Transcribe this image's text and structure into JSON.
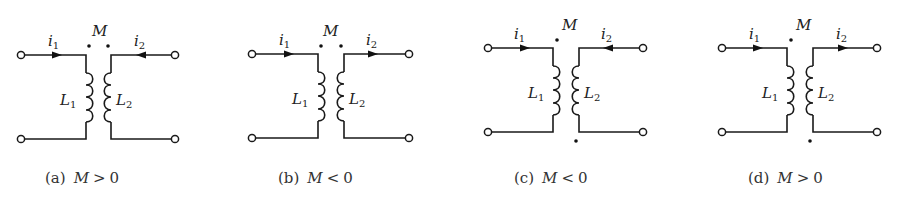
{
  "figure": {
    "panels": [
      {
        "id": "a",
        "caption_tag": "(a)",
        "caption_var": "M",
        "caption_op": ">",
        "caption_val": "0",
        "mutual_label": "M",
        "L1_label": "L",
        "L1_sub": "1",
        "L2_label": "L",
        "L2_sub": "2",
        "i1_label": "i",
        "i1_sub": "1",
        "i2_label": "i",
        "i2_sub": "2",
        "i1_direction": "right",
        "i2_direction": "left",
        "dots": "both-top"
      },
      {
        "id": "b",
        "caption_tag": "(b)",
        "caption_var": "M",
        "caption_op": "<",
        "caption_val": "0",
        "mutual_label": "M",
        "L1_label": "L",
        "L1_sub": "1",
        "L2_label": "L",
        "L2_sub": "2",
        "i1_label": "i",
        "i1_sub": "1",
        "i2_label": "i",
        "i2_sub": "2",
        "i1_direction": "right",
        "i2_direction": "right",
        "dots": "both-top"
      },
      {
        "id": "c",
        "caption_tag": "(c)",
        "caption_var": "M",
        "caption_op": "<",
        "caption_val": "0",
        "mutual_label": "M",
        "L1_label": "L",
        "L1_sub": "1",
        "L2_label": "L",
        "L2_sub": "2",
        "i1_label": "i",
        "i1_sub": "1",
        "i2_label": "i",
        "i2_sub": "2",
        "i1_direction": "right",
        "i2_direction": "left",
        "dots": "L1-top-L2-bottom"
      },
      {
        "id": "d",
        "caption_tag": "(d)",
        "caption_var": "M",
        "caption_op": ">",
        "caption_val": "0",
        "mutual_label": "M",
        "L1_label": "L",
        "L1_sub": "1",
        "L2_label": "L",
        "L2_sub": "2",
        "i1_label": "i",
        "i1_sub": "1",
        "i2_label": "i",
        "i2_sub": "2",
        "i1_direction": "right",
        "i2_direction": "right",
        "dots": "L1-top-L2-bottom"
      }
    ]
  },
  "colors": {
    "ink": "#1a1a1a",
    "background": "#ffffff"
  }
}
